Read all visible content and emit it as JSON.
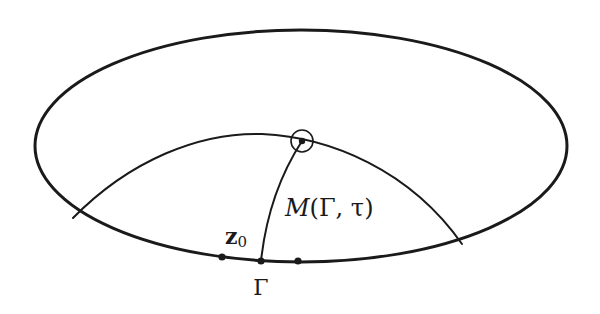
{
  "figure": {
    "colors": {
      "background": "#ffffff",
      "ink": "#1a1a1a"
    },
    "labels": {
      "z0_base": "z",
      "z0_sub": "0",
      "gamma": "Γ",
      "manifold_script": "M",
      "manifold_args": "(Γ, τ)"
    },
    "geometry": {
      "ellipse": {
        "cx": 301,
        "cy": 146,
        "rx": 266,
        "ry": 116
      },
      "arc": {
        "start": [
          73,
          218
        ],
        "peak": [
          260,
          134
        ],
        "end": [
          462,
          244
        ]
      },
      "circled_point": {
        "cx": 302,
        "cy": 141,
        "r": 11
      },
      "meridian": {
        "from": [
          302,
          141
        ],
        "to": [
          261,
          261
        ]
      },
      "boundary_points": [
        [
          222,
          257
        ],
        [
          261,
          261
        ],
        [
          298,
          261
        ]
      ]
    }
  }
}
